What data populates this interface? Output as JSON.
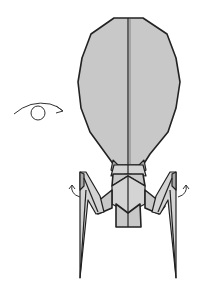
{
  "diagram": {
    "symbols": [
      {
        "name": "turn-over-symbol",
        "description": "eye/circle with curved arrow indicating turn model over"
      },
      {
        "name": "left-leg-rotate-arrow",
        "description": "small curved arrow at left leg joint"
      },
      {
        "name": "right-leg-rotate-arrow",
        "description": "small curved arrow at right leg joint"
      }
    ],
    "parts": [
      "head",
      "collar",
      "tail-body",
      "left-leg",
      "right-leg"
    ],
    "colors": {
      "paper_fill": "#c8c8c8",
      "paper_shadow": "#a9a9a9",
      "outline": "#222222",
      "background": "#ffffff"
    }
  }
}
